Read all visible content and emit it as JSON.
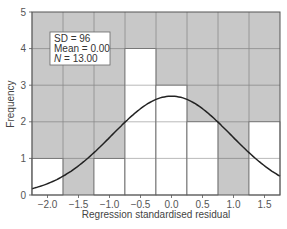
{
  "chart_data": {
    "type": "bar",
    "subtype": "histogram_with_normal_curve",
    "title": "",
    "xlabel": "Regression standardised residual",
    "ylabel": "Frequency",
    "categories": [
      "-2.0",
      "-1.5",
      "-1.0",
      "-0.5",
      "0.0",
      "0.5",
      "1.0",
      "1.5"
    ],
    "bin_centers": [
      -2.0,
      -1.5,
      -1.0,
      -0.5,
      0.0,
      0.5,
      1.0,
      1.5
    ],
    "values": [
      1,
      0,
      1,
      4,
      3,
      2,
      0,
      2
    ],
    "x_tick_labels": [
      "−2.0",
      "−1.5",
      "−1.0",
      "−0.5",
      "0.0",
      "0.5",
      "1.0",
      "1.5"
    ],
    "y_tick_labels": [
      "0",
      "1",
      "2",
      "3",
      "4",
      "5"
    ],
    "ylim": [
      0,
      5
    ],
    "xlim": [
      -2.25,
      1.75
    ],
    "grid": true,
    "normal_curve": {
      "mean": 0.0,
      "sd": 0.96,
      "n": 13,
      "bin_width": 0.5
    },
    "legend": {
      "position": "upper-left",
      "lines": [
        "SD = 96",
        "Mean = 0.00",
        "N = 13.00"
      ]
    },
    "colors": {
      "background": "#c8c8c8",
      "bar_fill": "#ffffff",
      "bar_edge": "#666666",
      "grid": "#8a8a8a",
      "curve": "#222222",
      "frame": "#555555"
    }
  },
  "legend": {
    "sd_label": "SD = 96",
    "mean_label": "Mean = 0.00",
    "n_symbol": "N",
    "n_value": " = 13.00"
  },
  "axes": {
    "x_title": "Regression standardised residual",
    "y_title": "Frequency",
    "x_ticks": [
      "−2.0",
      "−1.5",
      "−1.0",
      "−0.5",
      "0.0",
      "0.5",
      "1.0",
      "1.5"
    ],
    "y_ticks": [
      "0",
      "1",
      "2",
      "3",
      "4",
      "5"
    ]
  }
}
